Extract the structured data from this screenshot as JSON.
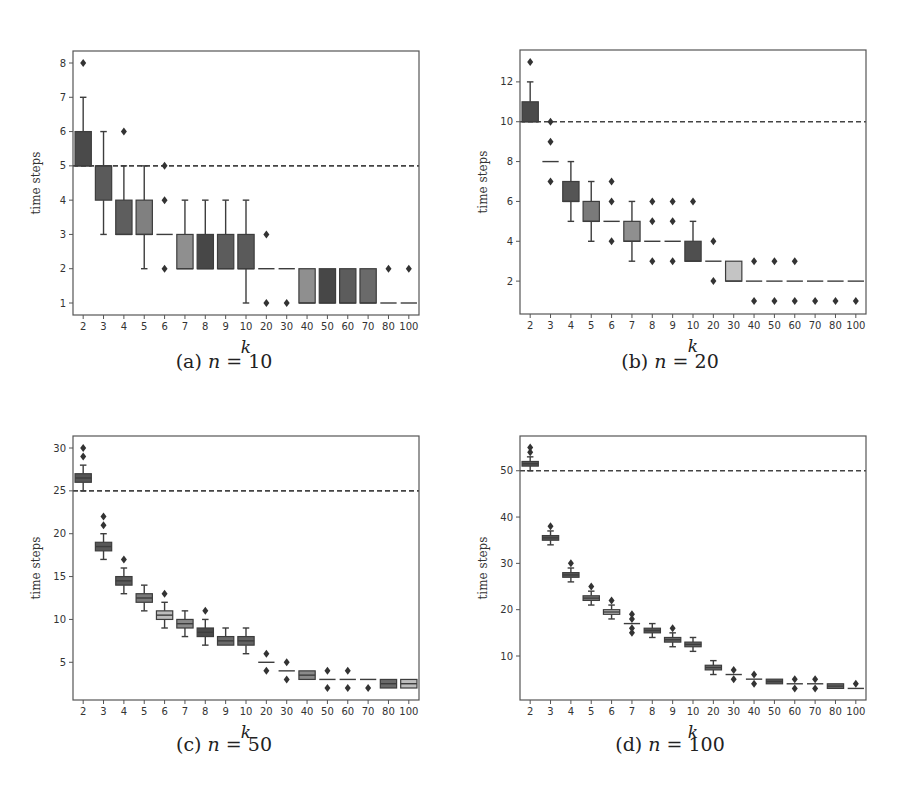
{
  "figure": {
    "xlabel": "k",
    "ylabel": "time steps"
  },
  "chart_data": [
    {
      "type": "box",
      "panel": "a",
      "caption_prefix": "(a)",
      "caption_var": "n",
      "caption_value": "10",
      "title": "(a) n = 10",
      "xlabel": "k",
      "ylabel": "time steps",
      "categories": [
        "2",
        "3",
        "4",
        "5",
        "6",
        "7",
        "8",
        "9",
        "10",
        "20",
        "30",
        "40",
        "50",
        "60",
        "70",
        "80",
        "100"
      ],
      "yticks": [
        1,
        2,
        3,
        4,
        5,
        6,
        7,
        8
      ],
      "ylim": [
        0.65,
        8.35
      ],
      "reference_line": 5,
      "boxes": [
        {
          "q1": 5,
          "median": 5,
          "q3": 6,
          "whislo": 5,
          "whishi": 7,
          "fliers": [
            8
          ],
          "color": "#4a4a4a"
        },
        {
          "q1": 4,
          "median": 5,
          "q3": 5,
          "whislo": 3,
          "whishi": 6,
          "fliers": [],
          "color": "#5a5a5a"
        },
        {
          "q1": 3,
          "median": 3,
          "q3": 4,
          "whislo": 3,
          "whishi": 5,
          "fliers": [
            6
          ],
          "color": "#5e5e5e"
        },
        {
          "q1": 3,
          "median": 3,
          "q3": 4,
          "whislo": 2,
          "whishi": 5,
          "fliers": [],
          "color": "#808080"
        },
        {
          "q1": 3,
          "median": 3,
          "q3": 3,
          "whislo": 3,
          "whishi": 3,
          "fliers": [
            2,
            4,
            5
          ],
          "color": "#666666"
        },
        {
          "q1": 2,
          "median": 2,
          "q3": 3,
          "whislo": 2,
          "whishi": 4,
          "fliers": [],
          "color": "#8f8f8f"
        },
        {
          "q1": 2,
          "median": 2,
          "q3": 3,
          "whislo": 2,
          "whishi": 4,
          "fliers": [],
          "color": "#474747"
        },
        {
          "q1": 2,
          "median": 2,
          "q3": 3,
          "whislo": 2,
          "whishi": 4,
          "fliers": [],
          "color": "#5c5c5c"
        },
        {
          "q1": 2,
          "median": 2,
          "q3": 3,
          "whislo": 1,
          "whishi": 4,
          "fliers": [],
          "color": "#5a5a5a"
        },
        {
          "q1": 2,
          "median": 2,
          "q3": 2,
          "whislo": 2,
          "whishi": 2,
          "fliers": [
            1,
            3
          ],
          "color": "#666666"
        },
        {
          "q1": 2,
          "median": 2,
          "q3": 2,
          "whislo": 2,
          "whishi": 2,
          "fliers": [
            1
          ],
          "color": "#666666"
        },
        {
          "q1": 1,
          "median": 1,
          "q3": 2,
          "whislo": 1,
          "whishi": 2,
          "fliers": [],
          "color": "#8f8f8f"
        },
        {
          "q1": 1,
          "median": 1,
          "q3": 2,
          "whislo": 1,
          "whishi": 2,
          "fliers": [],
          "color": "#474747"
        },
        {
          "q1": 1,
          "median": 1,
          "q3": 2,
          "whislo": 1,
          "whishi": 2,
          "fliers": [],
          "color": "#5c5c5c"
        },
        {
          "q1": 1,
          "median": 1,
          "q3": 2,
          "whislo": 1,
          "whishi": 2,
          "fliers": [],
          "color": "#6a6a6a"
        },
        {
          "q1": 1,
          "median": 1,
          "q3": 1,
          "whislo": 1,
          "whishi": 1,
          "fliers": [
            2
          ],
          "color": "#666666"
        },
        {
          "q1": 1,
          "median": 1,
          "q3": 1,
          "whislo": 1,
          "whishi": 1,
          "fliers": [
            2
          ],
          "color": "#666666"
        }
      ]
    },
    {
      "type": "box",
      "panel": "b",
      "caption_prefix": "(b)",
      "caption_var": "n",
      "caption_value": "20",
      "title": "(b) n = 20",
      "xlabel": "k",
      "ylabel": "time steps",
      "categories": [
        "2",
        "3",
        "4",
        "5",
        "6",
        "7",
        "8",
        "9",
        "10",
        "20",
        "30",
        "40",
        "50",
        "60",
        "70",
        "80",
        "100"
      ],
      "yticks": [
        2,
        4,
        6,
        8,
        10,
        12
      ],
      "ylim": [
        0.35,
        13.6
      ],
      "reference_line": 10,
      "boxes": [
        {
          "q1": 10,
          "median": 10,
          "q3": 11,
          "whislo": 10,
          "whishi": 12,
          "fliers": [
            13
          ],
          "color": "#4a4a4a"
        },
        {
          "q1": 8,
          "median": 8,
          "q3": 8,
          "whislo": 8,
          "whishi": 8,
          "fliers": [
            7,
            9,
            10
          ],
          "color": "#666666"
        },
        {
          "q1": 6,
          "median": 6,
          "q3": 7,
          "whislo": 5,
          "whishi": 8,
          "fliers": [],
          "color": "#555555"
        },
        {
          "q1": 5,
          "median": 5,
          "q3": 6,
          "whislo": 4,
          "whishi": 7,
          "fliers": [],
          "color": "#7a7a7a"
        },
        {
          "q1": 5,
          "median": 5,
          "q3": 5,
          "whislo": 5,
          "whishi": 5,
          "fliers": [
            4,
            6,
            7
          ],
          "color": "#666666"
        },
        {
          "q1": 4,
          "median": 4,
          "q3": 5,
          "whislo": 3,
          "whishi": 6,
          "fliers": [],
          "color": "#8f8f8f"
        },
        {
          "q1": 4,
          "median": 4,
          "q3": 4,
          "whislo": 4,
          "whishi": 4,
          "fliers": [
            3,
            5,
            6
          ],
          "color": "#666666"
        },
        {
          "q1": 4,
          "median": 4,
          "q3": 4,
          "whislo": 4,
          "whishi": 4,
          "fliers": [
            3,
            5,
            6
          ],
          "color": "#666666"
        },
        {
          "q1": 3,
          "median": 3,
          "q3": 4,
          "whislo": 3,
          "whishi": 5,
          "fliers": [
            6
          ],
          "color": "#4f4f4f"
        },
        {
          "q1": 3,
          "median": 3,
          "q3": 3,
          "whislo": 3,
          "whishi": 3,
          "fliers": [
            2,
            4
          ],
          "color": "#666666"
        },
        {
          "q1": 2,
          "median": 2,
          "q3": 3,
          "whislo": 2,
          "whishi": 3,
          "fliers": [],
          "color": "#c4c4c4"
        },
        {
          "q1": 2,
          "median": 2,
          "q3": 2,
          "whislo": 2,
          "whishi": 2,
          "fliers": [
            1,
            3
          ],
          "color": "#666666"
        },
        {
          "q1": 2,
          "median": 2,
          "q3": 2,
          "whislo": 2,
          "whishi": 2,
          "fliers": [
            1,
            3
          ],
          "color": "#666666"
        },
        {
          "q1": 2,
          "median": 2,
          "q3": 2,
          "whislo": 2,
          "whishi": 2,
          "fliers": [
            1,
            3
          ],
          "color": "#666666"
        },
        {
          "q1": 2,
          "median": 2,
          "q3": 2,
          "whislo": 2,
          "whishi": 2,
          "fliers": [
            1
          ],
          "color": "#666666"
        },
        {
          "q1": 2,
          "median": 2,
          "q3": 2,
          "whislo": 2,
          "whishi": 2,
          "fliers": [
            1
          ],
          "color": "#666666"
        },
        {
          "q1": 2,
          "median": 2,
          "q3": 2,
          "whislo": 2,
          "whishi": 2,
          "fliers": [
            1
          ],
          "color": "#666666"
        }
      ]
    },
    {
      "type": "box",
      "panel": "c",
      "caption_prefix": "(c)",
      "caption_var": "n",
      "caption_value": "50",
      "title": "(c) n = 50",
      "xlabel": "k",
      "ylabel": "time steps",
      "categories": [
        "2",
        "3",
        "4",
        "5",
        "6",
        "7",
        "8",
        "9",
        "10",
        "20",
        "30",
        "40",
        "50",
        "60",
        "70",
        "80",
        "100"
      ],
      "yticks": [
        5,
        10,
        15,
        20,
        25,
        30
      ],
      "ylim": [
        0.6,
        31.4
      ],
      "reference_line": 25,
      "boxes": [
        {
          "q1": 26,
          "median": 26.5,
          "q3": 27,
          "whislo": 25,
          "whishi": 28,
          "fliers": [
            29,
            30
          ],
          "color": "#555555"
        },
        {
          "q1": 18,
          "median": 18.5,
          "q3": 19,
          "whislo": 17,
          "whishi": 20,
          "fliers": [
            21,
            22
          ],
          "color": "#585858"
        },
        {
          "q1": 14,
          "median": 14.5,
          "q3": 15,
          "whislo": 13,
          "whishi": 16,
          "fliers": [
            17
          ],
          "color": "#5a5a5a"
        },
        {
          "q1": 12,
          "median": 12.5,
          "q3": 13,
          "whislo": 11,
          "whishi": 14,
          "fliers": [],
          "color": "#7a7a7a"
        },
        {
          "q1": 10,
          "median": 10.5,
          "q3": 11,
          "whislo": 9,
          "whishi": 12,
          "fliers": [
            13
          ],
          "color": "#bdbdbd"
        },
        {
          "q1": 9,
          "median": 9.5,
          "q3": 10,
          "whislo": 8,
          "whishi": 11,
          "fliers": [],
          "color": "#8a8a8a"
        },
        {
          "q1": 8,
          "median": 8.5,
          "q3": 9,
          "whislo": 7,
          "whishi": 10,
          "fliers": [
            11
          ],
          "color": "#4a4a4a"
        },
        {
          "q1": 7,
          "median": 7.5,
          "q3": 8,
          "whislo": 7,
          "whishi": 9,
          "fliers": [],
          "color": "#6a6a6a"
        },
        {
          "q1": 7,
          "median": 7.5,
          "q3": 8,
          "whislo": 6,
          "whishi": 9,
          "fliers": [],
          "color": "#626262"
        },
        {
          "q1": 5,
          "median": 5,
          "q3": 5,
          "whislo": 5,
          "whishi": 5,
          "fliers": [
            4,
            6
          ],
          "color": "#666666"
        },
        {
          "q1": 4,
          "median": 4,
          "q3": 4,
          "whislo": 4,
          "whishi": 4,
          "fliers": [
            3,
            5
          ],
          "color": "#666666"
        },
        {
          "q1": 3,
          "median": 3.5,
          "q3": 4,
          "whislo": 3,
          "whishi": 4,
          "fliers": [],
          "color": "#8a8a8a"
        },
        {
          "q1": 3,
          "median": 3,
          "q3": 3,
          "whislo": 3,
          "whishi": 3,
          "fliers": [
            2,
            4
          ],
          "color": "#666666"
        },
        {
          "q1": 3,
          "median": 3,
          "q3": 3,
          "whislo": 3,
          "whishi": 3,
          "fliers": [
            2,
            4
          ],
          "color": "#666666"
        },
        {
          "q1": 3,
          "median": 3,
          "q3": 3,
          "whislo": 3,
          "whishi": 3,
          "fliers": [
            2
          ],
          "color": "#666666"
        },
        {
          "q1": 2,
          "median": 2.5,
          "q3": 3,
          "whislo": 2,
          "whishi": 3,
          "fliers": [],
          "color": "#6a6a6a"
        },
        {
          "q1": 2,
          "median": 2.5,
          "q3": 3,
          "whislo": 2,
          "whishi": 3,
          "fliers": [],
          "color": "#bdbdbd"
        }
      ]
    },
    {
      "type": "box",
      "panel": "d",
      "caption_prefix": "(d)",
      "caption_var": "n",
      "caption_value": "100",
      "title": "(d) n = 100",
      "xlabel": "k",
      "ylabel": "time steps",
      "categories": [
        "2",
        "3",
        "4",
        "5",
        "6",
        "7",
        "8",
        "9",
        "10",
        "20",
        "30",
        "40",
        "50",
        "60",
        "70",
        "80",
        "100"
      ],
      "yticks": [
        10,
        20,
        30,
        40,
        50
      ],
      "ylim": [
        0.5,
        57.5
      ],
      "reference_line": 50,
      "boxes": [
        {
          "q1": 51,
          "median": 51.5,
          "q3": 52,
          "whislo": 50,
          "whishi": 53,
          "fliers": [
            54,
            55
          ],
          "color": "#555555"
        },
        {
          "q1": 35,
          "median": 35.5,
          "q3": 36,
          "whislo": 34,
          "whishi": 37,
          "fliers": [
            38
          ],
          "color": "#585858"
        },
        {
          "q1": 27,
          "median": 27.5,
          "q3": 28,
          "whislo": 26,
          "whishi": 29,
          "fliers": [
            30
          ],
          "color": "#5a5a5a"
        },
        {
          "q1": 22,
          "median": 22.5,
          "q3": 23,
          "whislo": 21,
          "whishi": 24,
          "fliers": [
            25
          ],
          "color": "#7a7a7a"
        },
        {
          "q1": 19,
          "median": 19.5,
          "q3": 20,
          "whislo": 18,
          "whishi": 21,
          "fliers": [
            22
          ],
          "color": "#bdbdbd"
        },
        {
          "q1": 17,
          "median": 17,
          "q3": 17,
          "whislo": 17,
          "whishi": 17,
          "fliers": [
            15,
            16,
            18,
            19
          ],
          "color": "#666666"
        },
        {
          "q1": 15,
          "median": 15.5,
          "q3": 16,
          "whislo": 14,
          "whishi": 17,
          "fliers": [],
          "color": "#555555"
        },
        {
          "q1": 13,
          "median": 13.5,
          "q3": 14,
          "whislo": 12,
          "whishi": 15,
          "fliers": [
            16
          ],
          "color": "#6a6a6a"
        },
        {
          "q1": 12,
          "median": 12.5,
          "q3": 13,
          "whislo": 11,
          "whishi": 14,
          "fliers": [],
          "color": "#626262"
        },
        {
          "q1": 7,
          "median": 7.5,
          "q3": 8,
          "whislo": 6,
          "whishi": 9,
          "fliers": [],
          "color": "#6a6a6a"
        },
        {
          "q1": 6,
          "median": 6,
          "q3": 6,
          "whislo": 6,
          "whishi": 6,
          "fliers": [
            5,
            7
          ],
          "color": "#666666"
        },
        {
          "q1": 5,
          "median": 5,
          "q3": 5,
          "whislo": 5,
          "whishi": 5,
          "fliers": [
            4,
            6
          ],
          "color": "#666666"
        },
        {
          "q1": 4,
          "median": 4.5,
          "q3": 5,
          "whislo": 4,
          "whishi": 5,
          "fliers": [],
          "color": "#555555"
        },
        {
          "q1": 4,
          "median": 4,
          "q3": 4,
          "whislo": 4,
          "whishi": 4,
          "fliers": [
            3,
            5
          ],
          "color": "#666666"
        },
        {
          "q1": 4,
          "median": 4,
          "q3": 4,
          "whislo": 4,
          "whishi": 4,
          "fliers": [
            3,
            5
          ],
          "color": "#666666"
        },
        {
          "q1": 3,
          "median": 3.5,
          "q3": 4,
          "whislo": 3,
          "whishi": 4,
          "fliers": [],
          "color": "#6a6a6a"
        },
        {
          "q1": 3,
          "median": 3,
          "q3": 3,
          "whislo": 3,
          "whishi": 3,
          "fliers": [
            4
          ],
          "color": "#666666"
        }
      ]
    }
  ],
  "layout": {
    "panels": [
      {
        "left": 73,
        "top": 51,
        "width": 346,
        "height": 264,
        "caption_x": 224,
        "caption_y": 362
      },
      {
        "left": 520,
        "top": 50,
        "width": 346,
        "height": 264,
        "caption_x": 670,
        "caption_y": 362
      },
      {
        "left": 73,
        "top": 436,
        "width": 346,
        "height": 264,
        "caption_x": 224,
        "caption_y": 745
      },
      {
        "left": 520,
        "top": 436,
        "width": 346,
        "height": 264,
        "caption_x": 670,
        "caption_y": 745
      }
    ]
  }
}
